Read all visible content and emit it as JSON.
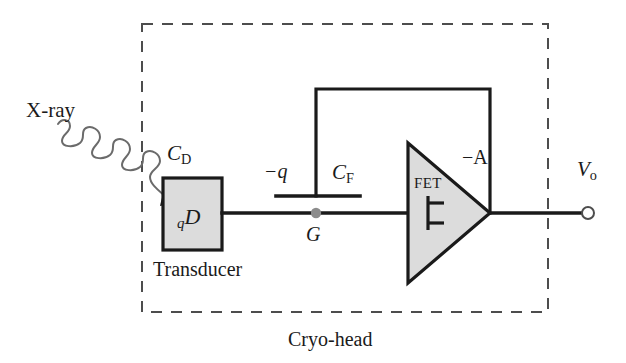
{
  "figure": {
    "type": "circuit-schematic",
    "background_color": "#ffffff",
    "line_color": "#1a1a1a",
    "fill_color": "#dcdcdc",
    "node_dot_color": "#8c8c8c"
  },
  "labels": {
    "xray": "X-ray",
    "detector_capacitance": "C",
    "detector_capacitance_sub": "D",
    "detector_charge_pre": "q",
    "detector_charge": "D",
    "transducer": "Transducer",
    "feedback_charge": "−q",
    "feedback_capacitance": "C",
    "feedback_capacitance_sub": "F",
    "gate_node": "G",
    "fet": "FET",
    "gain": "−A",
    "output_voltage": "V",
    "output_voltage_sub": "o",
    "enclosure": "Cryo-head"
  },
  "components": {
    "transducer_box": {
      "name": "Transducer",
      "x": 163,
      "y": 178,
      "width": 59,
      "height": 72,
      "fill": "#dcdcdc",
      "stroke": "#1a1a1a",
      "stroke_width": 3
    },
    "amplifier_triangle": {
      "name": "FET amplifier",
      "gain": "−A",
      "points": "408,143 408,283 490,213",
      "fill": "#dcdcdc",
      "stroke": "#1a1a1a",
      "stroke_width": 3
    },
    "feedback_capacitor": {
      "name": "C_F",
      "plate_y": 196,
      "plate_x1": 276,
      "plate_x2": 360,
      "stem_x": 316,
      "stem_top": 89
    },
    "gate_node": {
      "name": "G",
      "x": 316,
      "y": 213,
      "radius": 5
    },
    "output_terminal": {
      "name": "V_o",
      "x": 588,
      "y": 213,
      "radius": 6
    },
    "enclosure_dashed_box": {
      "name": "Cryo-head",
      "x": 142,
      "y": 24,
      "width": 406,
      "height": 288,
      "dash": "11 9",
      "stroke": "#4d4d4d",
      "stroke_width": 2
    },
    "signal_wire_y": 213,
    "feedback_wire": {
      "left_x": 316,
      "top_y": 89,
      "right_x": 490
    },
    "xray_arrow": {
      "description": "wavy arrow from upper-left into transducer",
      "start": [
        60,
        125
      ],
      "end": [
        163,
        205
      ]
    }
  }
}
